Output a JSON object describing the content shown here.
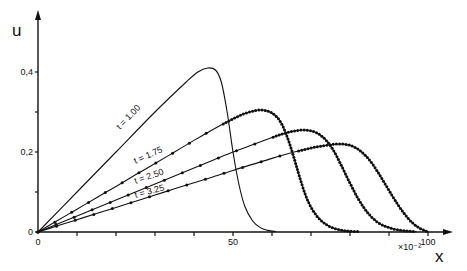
{
  "chart_data": {
    "type": "line",
    "title": "",
    "xlabel": "x",
    "ylabel": "u",
    "x_multiplier": "×10⁻²",
    "xlim": [
      0,
      100
    ],
    "ylim": [
      0,
      0.45
    ],
    "grid": false,
    "x_ticks": [
      0,
      10,
      20,
      30,
      40,
      50,
      60,
      70,
      80,
      90,
      100
    ],
    "x_tick_labels": [
      {
        "value": 0,
        "label": "0"
      },
      {
        "value": 50,
        "label": "50"
      },
      {
        "value": 100,
        "label": "100"
      }
    ],
    "y_ticks": [
      0,
      0.1,
      0.2,
      0.3,
      0.4
    ],
    "y_tick_labels": [
      {
        "value": 0,
        "label": "0"
      },
      {
        "value": 0.2,
        "label": "0,2"
      },
      {
        "value": 0.4,
        "label": "0,4"
      }
    ],
    "series": [
      {
        "name": "t = 1.00",
        "markers": false,
        "x": [
          0,
          10,
          20,
          30,
          38,
          41,
          43.5,
          45.5,
          47,
          48.5,
          50,
          51.5,
          53,
          55,
          57,
          59,
          61
        ],
        "y": [
          0,
          0.1,
          0.2,
          0.3,
          0.375,
          0.4,
          0.41,
          0.405,
          0.375,
          0.3,
          0.2,
          0.12,
          0.065,
          0.028,
          0.011,
          0.004,
          0.001
        ]
      },
      {
        "name": "t = 1.75",
        "markers": true,
        "x": [
          0,
          5,
          10,
          15,
          20,
          25,
          30,
          35,
          40,
          45,
          50,
          53,
          55,
          57,
          59,
          61,
          62.5,
          64,
          65.5,
          67,
          68.5,
          70,
          72,
          74,
          76,
          78,
          80,
          82
        ],
        "y": [
          0,
          0.0286,
          0.0571,
          0.0857,
          0.114,
          0.143,
          0.171,
          0.2,
          0.229,
          0.257,
          0.283,
          0.296,
          0.302,
          0.305,
          0.302,
          0.29,
          0.27,
          0.235,
          0.19,
          0.14,
          0.095,
          0.062,
          0.034,
          0.018,
          0.009,
          0.004,
          0.002,
          0.001
        ]
      },
      {
        "name": "t = 2.50",
        "markers": true,
        "x": [
          0,
          5,
          10,
          15,
          20,
          25,
          30,
          35,
          40,
          45,
          50,
          55,
          60,
          63,
          66,
          68,
          70,
          72,
          74,
          76,
          78,
          80,
          82,
          84,
          86,
          88,
          91,
          94,
          97
        ],
        "y": [
          0,
          0.02,
          0.04,
          0.06,
          0.08,
          0.1,
          0.12,
          0.14,
          0.16,
          0.18,
          0.2,
          0.218,
          0.236,
          0.246,
          0.253,
          0.255,
          0.253,
          0.245,
          0.228,
          0.2,
          0.162,
          0.122,
          0.085,
          0.055,
          0.033,
          0.019,
          0.008,
          0.003,
          0.001
        ]
      },
      {
        "name": "t = 3.25",
        "markers": true,
        "x": [
          0,
          5,
          10,
          15,
          20,
          25,
          30,
          35,
          40,
          45,
          50,
          55,
          60,
          65,
          70,
          74,
          77,
          79,
          81,
          83,
          85,
          87,
          89,
          91,
          93,
          95,
          97,
          99,
          100
        ],
        "y": [
          0,
          0.0154,
          0.0308,
          0.0462,
          0.0615,
          0.0769,
          0.0923,
          0.108,
          0.123,
          0.138,
          0.154,
          0.169,
          0.184,
          0.198,
          0.21,
          0.217,
          0.22,
          0.219,
          0.213,
          0.2,
          0.18,
          0.152,
          0.12,
          0.088,
          0.058,
          0.033,
          0.015,
          0.004,
          0.001
        ]
      }
    ],
    "annotations": [
      {
        "text": "t = 1.00",
        "x": 21,
        "y": 0.255,
        "angle": -46
      },
      {
        "text": "t = 1.75",
        "x": 25,
        "y": 0.17,
        "angle": -24
      },
      {
        "text": "t = 2.50",
        "x": 25,
        "y": 0.12,
        "angle": -19
      },
      {
        "text": "t = 3.25",
        "x": 25,
        "y": 0.085,
        "angle": -15
      }
    ]
  }
}
